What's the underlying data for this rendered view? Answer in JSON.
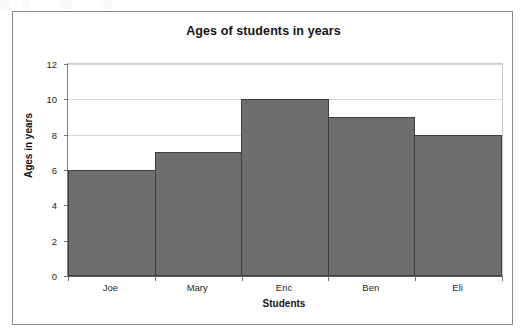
{
  "chart_data": {
    "type": "bar",
    "title": "Ages of students in years",
    "xlabel": "Students",
    "ylabel": "Ages in years",
    "categories": [
      "Joe",
      "Mary",
      "Eric",
      "Ben",
      "Eli"
    ],
    "values": [
      6,
      7,
      10,
      9,
      8
    ],
    "ylim": [
      0,
      12
    ],
    "yticks": [
      0,
      2,
      4,
      6,
      8,
      10,
      12
    ],
    "ytick_labels": [
      "0",
      "2",
      "4",
      "6",
      "8",
      "10",
      "12"
    ],
    "grid": true,
    "legend": "none",
    "bar_color": "#6e6e6e",
    "bar_edge_color": "#3f3f3f",
    "grid_color": "#d6d6d6",
    "axis_color": "#5a5a5a",
    "frame_color": "#8a8a8a",
    "background": "#ffffff"
  }
}
